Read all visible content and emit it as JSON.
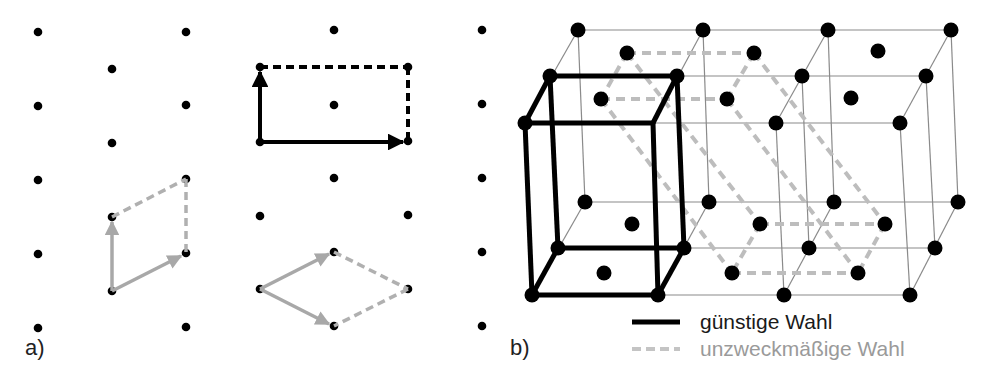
{
  "figure": {
    "panel_a": {
      "label": "a)",
      "description": "2D lattice with different unit cell choices",
      "dot_color": "#000000",
      "good_choice_color": "#000000",
      "bad_choice_color": "#aaaaaa"
    },
    "panel_b": {
      "label": "b)",
      "description": "3D lattice with favorable (bold black) and unsuitable (dashed gray) unit cell choices",
      "legend": {
        "good": {
          "label": "günstige Wahl",
          "style": "solid",
          "color": "#000000"
        },
        "bad": {
          "label": "unzweckmäßige Wahl",
          "style": "dashed",
          "color": "#bbbbbb"
        }
      }
    }
  },
  "colors": {
    "black": "#000000",
    "gray_dash": "#b8b8b8",
    "grid_line": "#888888",
    "bad_text": "#9a9a9a"
  }
}
